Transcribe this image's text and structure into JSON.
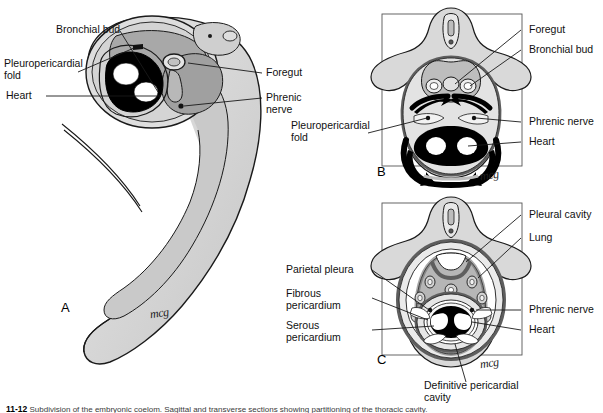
{
  "figure": {
    "signature": "mcg",
    "caption_prefix": "11-12",
    "caption_text": "Subdivision of the embryonic coelom. Sagittal and transverse sections showing partitioning of the thoracic cavity."
  },
  "panels": [
    {
      "id": "A",
      "letter": "A",
      "signature": "mcg",
      "labels": [
        {
          "name": "bronchial-bud",
          "text": "Bronchial bud"
        },
        {
          "name": "pleuropericardial-fold",
          "text": "Pleuropericardial\nfold"
        },
        {
          "name": "heart",
          "text": "Heart"
        },
        {
          "name": "foregut",
          "text": "Foregut"
        },
        {
          "name": "phrenic-nerve",
          "text": "Phrenic\nnerve"
        }
      ]
    },
    {
      "id": "B",
      "letter": "B",
      "signature": "mcg",
      "labels": [
        {
          "name": "foregut",
          "text": "Foregut"
        },
        {
          "name": "bronchial-bud",
          "text": "Bronchial bud"
        },
        {
          "name": "phrenic-nerve",
          "text": "Phrenic nerve"
        },
        {
          "name": "heart",
          "text": "Heart"
        },
        {
          "name": "pleuropericardial-fold",
          "text": "Pleuropericardial\nfold"
        }
      ]
    },
    {
      "id": "C",
      "letter": "C",
      "signature": "mcg",
      "labels": [
        {
          "name": "pleural-cavity",
          "text": "Pleural cavity"
        },
        {
          "name": "lung",
          "text": "Lung"
        },
        {
          "name": "phrenic-nerve",
          "text": "Phrenic nerve"
        },
        {
          "name": "heart",
          "text": "Heart"
        },
        {
          "name": "parietal-pleura",
          "text": "Parietal pleura"
        },
        {
          "name": "fibrous-pericardium",
          "text": "Fibrous\npericardium"
        },
        {
          "name": "serous-pericardium",
          "text": "Serous\npericardium"
        },
        {
          "name": "definitive-pericardial-cavity",
          "text": "Definitive pericardial\ncavity"
        }
      ]
    }
  ],
  "colors": {
    "body_gray": "#d9d9d9",
    "mid_gray": "#9a9a9a",
    "dark_gray": "#6b6b6b",
    "black": "#000000",
    "white": "#ffffff",
    "line": "#1a1a1a"
  }
}
